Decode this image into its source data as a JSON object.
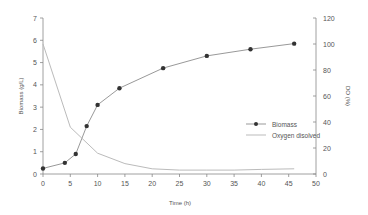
{
  "chart_data": {
    "type": "line",
    "title": "",
    "xlabel": "Time (h)",
    "ylabel": "Biomass (g/L)",
    "y2label": "DO (%)",
    "xlim": [
      0,
      50
    ],
    "ylim": [
      0,
      7
    ],
    "y2lim": [
      0,
      120
    ],
    "xticks": [
      0,
      5,
      10,
      15,
      20,
      25,
      30,
      35,
      40,
      45,
      50
    ],
    "yticks": [
      0,
      1,
      2,
      3,
      4,
      5,
      6,
      7
    ],
    "y2ticks": [
      0,
      20,
      40,
      60,
      80,
      100,
      120
    ],
    "grid": false,
    "legend_position": "right-center inside",
    "series": [
      {
        "name": "Biomass",
        "axis": "left",
        "marker": "circle",
        "color": "#999999",
        "marker_color": "#333333",
        "x": [
          0,
          4,
          6,
          8,
          10,
          14,
          22,
          30,
          38,
          46
        ],
        "values": [
          0.25,
          0.5,
          0.9,
          2.15,
          3.1,
          3.85,
          4.75,
          5.3,
          5.6,
          5.85
        ]
      },
      {
        "name": "Oxygen disolved",
        "axis": "right",
        "marker": "none",
        "color": "#bbbbbb",
        "x": [
          0,
          5,
          10,
          15,
          20,
          25,
          30,
          35,
          40,
          46
        ],
        "values": [
          100,
          36,
          16,
          8,
          4,
          3,
          3,
          3,
          3.5,
          4
        ]
      }
    ]
  }
}
